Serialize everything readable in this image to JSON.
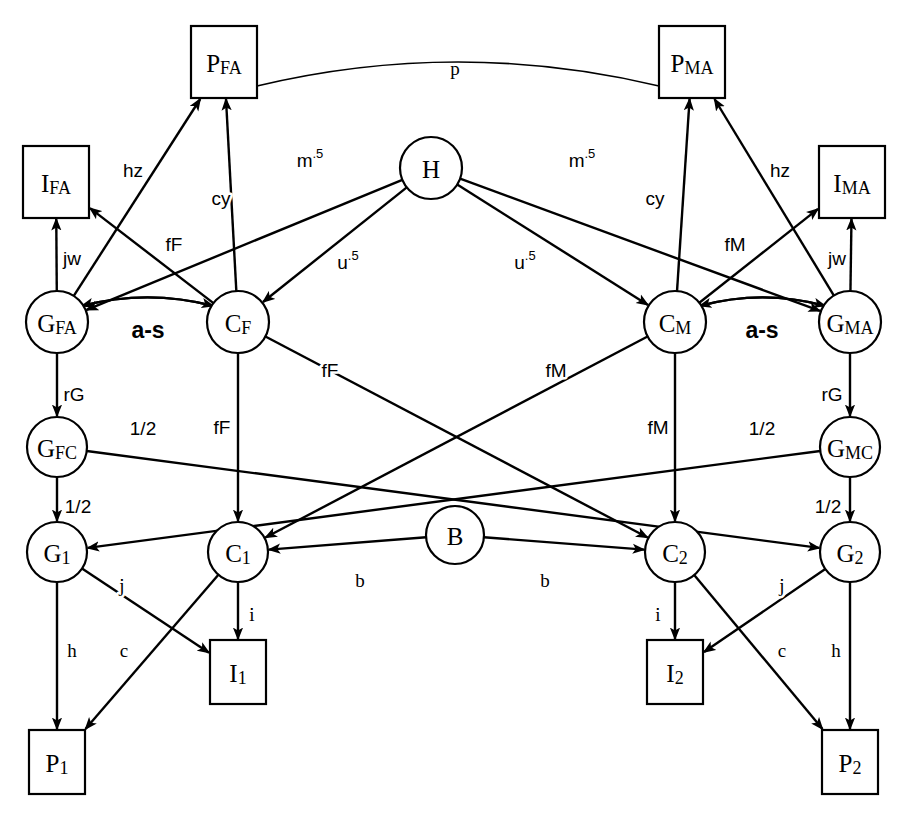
{
  "diagram": {
    "width": 900,
    "height": 822,
    "background_color": "#ffffff",
    "stroke_color": "#000000",
    "nodes": [
      {
        "id": "PFA",
        "label": "P",
        "sub": "FA",
        "shape": "box",
        "x": 224,
        "y": 62,
        "w": 66,
        "h": 72
      },
      {
        "id": "PMA",
        "label": "P",
        "sub": "MA",
        "shape": "box",
        "x": 692,
        "y": 62,
        "w": 66,
        "h": 72
      },
      {
        "id": "IFA",
        "label": "I",
        "sub": "FA",
        "shape": "box",
        "x": 56,
        "y": 182,
        "w": 66,
        "h": 72
      },
      {
        "id": "IMA",
        "label": "I",
        "sub": "MA",
        "shape": "box",
        "x": 852,
        "y": 182,
        "w": 66,
        "h": 72
      },
      {
        "id": "H",
        "label": "H",
        "sub": "",
        "shape": "circle",
        "x": 431,
        "y": 168,
        "r": 31
      },
      {
        "id": "GFA",
        "label": "G",
        "sub": "FA",
        "shape": "circle",
        "x": 57,
        "y": 322,
        "r": 31
      },
      {
        "id": "CF",
        "label": "C",
        "sub": "F",
        "shape": "circle",
        "x": 238,
        "y": 322,
        "r": 31
      },
      {
        "id": "CM",
        "label": "C",
        "sub": "M",
        "shape": "circle",
        "x": 675,
        "y": 322,
        "r": 31
      },
      {
        "id": "GMA",
        "label": "G",
        "sub": "MA",
        "shape": "circle",
        "x": 850,
        "y": 322,
        "r": 31
      },
      {
        "id": "GFC",
        "label": "G",
        "sub": "FC",
        "shape": "circle",
        "x": 57,
        "y": 447,
        "r": 30
      },
      {
        "id": "GMC",
        "label": "G",
        "sub": "MC",
        "shape": "circle",
        "x": 850,
        "y": 447,
        "r": 30
      },
      {
        "id": "G1",
        "label": "G",
        "sub": "1",
        "shape": "circle",
        "x": 57,
        "y": 552,
        "r": 30
      },
      {
        "id": "C1",
        "label": "C",
        "sub": "1",
        "shape": "circle",
        "x": 238,
        "y": 552,
        "r": 30
      },
      {
        "id": "B",
        "label": "B",
        "sub": "",
        "shape": "circle",
        "x": 455,
        "y": 535,
        "r": 29
      },
      {
        "id": "C2",
        "label": "C",
        "sub": "2",
        "shape": "circle",
        "x": 675,
        "y": 552,
        "r": 30
      },
      {
        "id": "G2",
        "label": "G",
        "sub": "2",
        "shape": "circle",
        "x": 850,
        "y": 552,
        "r": 30
      },
      {
        "id": "I1",
        "label": "I",
        "sub": "1",
        "shape": "box",
        "x": 238,
        "y": 672,
        "w": 56,
        "h": 64
      },
      {
        "id": "I2",
        "label": "I",
        "sub": "2",
        "shape": "box",
        "x": 675,
        "y": 672,
        "w": 56,
        "h": 64
      },
      {
        "id": "P1",
        "label": "P",
        "sub": "1",
        "shape": "box",
        "x": 57,
        "y": 762,
        "w": 56,
        "h": 64
      },
      {
        "id": "P2",
        "label": "P",
        "sub": "2",
        "shape": "box",
        "x": 850,
        "y": 762,
        "w": 56,
        "h": 64
      }
    ],
    "edges": [
      {
        "id": "e-pfa-pma",
        "from": "PFA",
        "to": "PMA",
        "label": "p",
        "sup": "",
        "kind": "arc-plain",
        "label_x": 455,
        "label_y": 68
      },
      {
        "id": "e-gfa-pfa",
        "from": "GFA",
        "to": "PFA",
        "label": "hz",
        "sup": "",
        "kind": "arrow",
        "label_x": 133,
        "label_y": 170
      },
      {
        "id": "e-gma-pma",
        "from": "GMA",
        "to": "PMA",
        "label": "hz",
        "sup": "",
        "kind": "arrow",
        "label_x": 780,
        "label_y": 170
      },
      {
        "id": "e-cf-pfa",
        "from": "CF",
        "to": "PFA",
        "label": "cy",
        "sup": "",
        "kind": "arrow",
        "label_x": 221,
        "label_y": 198
      },
      {
        "id": "e-cm-pma",
        "from": "CM",
        "to": "PMA",
        "label": "cy",
        "sup": "",
        "kind": "arrow",
        "label_x": 655,
        "label_y": 198
      },
      {
        "id": "e-gfa-ifa",
        "from": "GFA",
        "to": "IFA",
        "label": "jw",
        "sup": "",
        "kind": "arrow",
        "label_x": 72,
        "label_y": 258
      },
      {
        "id": "e-gma-ima",
        "from": "GMA",
        "to": "IMA",
        "label": "jw",
        "sup": "",
        "kind": "arrow",
        "label_x": 837,
        "label_y": 258
      },
      {
        "id": "e-cf-ifa",
        "from": "CF",
        "to": "IFA",
        "label": "fF",
        "sup": "",
        "kind": "arrow",
        "label_x": 174,
        "label_y": 244
      },
      {
        "id": "e-cm-ima",
        "from": "CM",
        "to": "IMA",
        "label": "fM",
        "sup": "",
        "kind": "arrow",
        "label_x": 735,
        "label_y": 244
      },
      {
        "id": "e-h-gfa",
        "from": "H",
        "to": "GFA",
        "label": "m",
        "sup": ".5",
        "kind": "arrow",
        "label_x": 310,
        "label_y": 160
      },
      {
        "id": "e-h-gma",
        "from": "H",
        "to": "GMA",
        "label": "m",
        "sup": ".5",
        "kind": "arrow",
        "label_x": 582,
        "label_y": 160
      },
      {
        "id": "e-h-cf",
        "from": "H",
        "to": "CF",
        "label": "u",
        "sup": ".5",
        "kind": "arrow",
        "label_x": 348,
        "label_y": 262
      },
      {
        "id": "e-h-cm",
        "from": "H",
        "to": "CM",
        "label": "u",
        "sup": ".5",
        "kind": "arrow",
        "label_x": 525,
        "label_y": 262
      },
      {
        "id": "e-gfa-cf",
        "from": "GFA",
        "to": "CF",
        "label": "a-s",
        "sup": "",
        "kind": "curve-both",
        "label_x": 148,
        "label_y": 330
      },
      {
        "id": "e-gma-cm",
        "from": "GMA",
        "to": "CM",
        "label": "a-s",
        "sup": "",
        "kind": "curve-both",
        "label_x": 762,
        "label_y": 330
      },
      {
        "id": "e-gfa-gfc",
        "from": "GFA",
        "to": "GFC",
        "label": "rG",
        "sup": "",
        "kind": "arrow",
        "label_x": 74,
        "label_y": 394
      },
      {
        "id": "e-gma-gmc",
        "from": "GMA",
        "to": "GMC",
        "label": "rG",
        "sup": "",
        "kind": "arrow",
        "label_x": 832,
        "label_y": 394
      },
      {
        "id": "e-cf-c1",
        "from": "CF",
        "to": "C1",
        "label": "fF",
        "sup": "",
        "kind": "arrow",
        "label_x": 222,
        "label_y": 427
      },
      {
        "id": "e-cm-c2",
        "from": "CM",
        "to": "C2",
        "label": "fM",
        "sup": "",
        "kind": "arrow",
        "label_x": 658,
        "label_y": 427
      },
      {
        "id": "e-cf-c2",
        "from": "CF",
        "to": "C2",
        "label": "fF",
        "sup": "",
        "kind": "arrow",
        "label_x": 330,
        "label_y": 370
      },
      {
        "id": "e-cm-c1",
        "from": "CM",
        "to": "C1",
        "label": "fM",
        "sup": "",
        "kind": "arrow",
        "label_x": 556,
        "label_y": 370
      },
      {
        "id": "e-gfc-g1",
        "from": "GFC",
        "to": "G1",
        "label": "1/2",
        "sup": "",
        "kind": "arrow",
        "label_x": 78,
        "label_y": 506
      },
      {
        "id": "e-gmc-g2",
        "from": "GMC",
        "to": "G2",
        "label": "1/2",
        "sup": "",
        "kind": "arrow",
        "label_x": 828,
        "label_y": 506
      },
      {
        "id": "e-gfc-g2",
        "from": "GFC",
        "to": "G2",
        "label": "1/2",
        "sup": "",
        "kind": "arrow",
        "label_x": 143,
        "label_y": 428
      },
      {
        "id": "e-gmc-g1",
        "from": "GMC",
        "to": "G1",
        "label": "1/2",
        "sup": "",
        "kind": "arrow",
        "label_x": 762,
        "label_y": 428
      },
      {
        "id": "e-b-c1",
        "from": "B",
        "to": "C1",
        "label": "b",
        "sup": "",
        "kind": "arrow",
        "label_x": 360,
        "label_y": 580
      },
      {
        "id": "e-b-c2",
        "from": "B",
        "to": "C2",
        "label": "b",
        "sup": "",
        "kind": "arrow",
        "label_x": 545,
        "label_y": 580
      },
      {
        "id": "e-g1-i1",
        "from": "G1",
        "to": "I1",
        "label": "j",
        "sup": "",
        "kind": "arrow",
        "label_x": 122,
        "label_y": 585
      },
      {
        "id": "e-g2-i2",
        "from": "G2",
        "to": "I2",
        "label": "j",
        "sup": "",
        "kind": "arrow",
        "label_x": 782,
        "label_y": 585
      },
      {
        "id": "e-c1-i1",
        "from": "C1",
        "to": "I1",
        "label": "i",
        "sup": "",
        "kind": "arrow",
        "label_x": 252,
        "label_y": 614
      },
      {
        "id": "e-c2-i2",
        "from": "C2",
        "to": "I2",
        "label": "i",
        "sup": "",
        "kind": "arrow",
        "label_x": 658,
        "label_y": 614
      },
      {
        "id": "e-g1-p1",
        "from": "G1",
        "to": "P1",
        "label": "h",
        "sup": "",
        "kind": "arrow",
        "label_x": 72,
        "label_y": 650
      },
      {
        "id": "e-g2-p2",
        "from": "G2",
        "to": "P2",
        "label": "h",
        "sup": "",
        "kind": "arrow",
        "label_x": 836,
        "label_y": 650
      },
      {
        "id": "e-c1-p1",
        "from": "C1",
        "to": "P1",
        "label": "c",
        "sup": "",
        "kind": "arrow",
        "label_x": 124,
        "label_y": 650
      },
      {
        "id": "e-c2-p2",
        "from": "C2",
        "to": "P2",
        "label": "c",
        "sup": "",
        "kind": "arrow",
        "label_x": 782,
        "label_y": 650
      }
    ]
  }
}
